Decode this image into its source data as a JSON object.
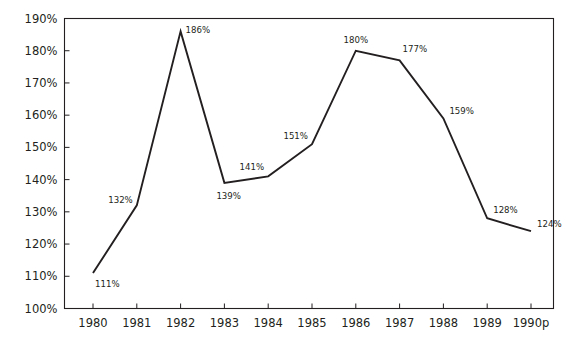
{
  "chart_data": {
    "type": "line",
    "title": "",
    "subtitle": "",
    "xlabel": "",
    "ylabel": "",
    "categories": [
      "1980",
      "1981",
      "1982",
      "1983",
      "1984",
      "1985",
      "1986",
      "1987",
      "1988",
      "1989",
      "1990p"
    ],
    "values": [
      111,
      132,
      186,
      139,
      141,
      151,
      180,
      177,
      159,
      128,
      124
    ],
    "point_labels": [
      "111%",
      "132%",
      "186%",
      "139%",
      "141%",
      "151%",
      "180%",
      "177%",
      "159%",
      "128%",
      "124%"
    ],
    "ylim": [
      100,
      190
    ],
    "ytick_values": [
      100,
      110,
      120,
      130,
      140,
      150,
      160,
      170,
      180,
      190
    ],
    "ytick_labels": [
      "100%",
      "110%",
      "120%",
      "130%",
      "140%",
      "150%",
      "160%",
      "170%",
      "180%",
      "190%"
    ],
    "grid": false,
    "legend": null,
    "legend_position": "none",
    "series": [
      {
        "name": "series-1",
        "values": [
          111,
          132,
          186,
          139,
          141,
          151,
          180,
          177,
          159,
          128,
          124
        ],
        "color": "#231f20"
      }
    ],
    "colors": {
      "line": "#231f20",
      "axis": "#231f20",
      "text": "#231f20",
      "background": "#ffffff"
    }
  },
  "label_placement": [
    {
      "value": "111%",
      "anchor": "start",
      "dx": 2,
      "dy": 14
    },
    {
      "value": "132%",
      "anchor": "end",
      "dx": -4,
      "dy": -2
    },
    {
      "value": "186%",
      "anchor": "start",
      "dx": 5,
      "dy": 2
    },
    {
      "value": "139%",
      "anchor": "start",
      "dx": -8,
      "dy": 16
    },
    {
      "value": "141%",
      "anchor": "end",
      "dx": -4,
      "dy": -6
    },
    {
      "value": "151%",
      "anchor": "end",
      "dx": -4,
      "dy": -5
    },
    {
      "value": "180%",
      "anchor": "mid",
      "dx": 0,
      "dy": -8
    },
    {
      "value": "177%",
      "anchor": "start",
      "dx": 3,
      "dy": -8
    },
    {
      "value": "159%",
      "anchor": "start",
      "dx": 6,
      "dy": -4
    },
    {
      "value": "128%",
      "anchor": "start",
      "dx": 6,
      "dy": -5
    },
    {
      "value": "124%",
      "anchor": "start",
      "dx": 6,
      "dy": -4
    }
  ]
}
